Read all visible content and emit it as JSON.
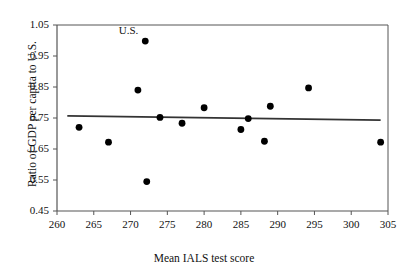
{
  "chart_data": {
    "type": "scatter",
    "title": "",
    "xlabel": "Mean IALS test score",
    "ylabel": "Ratio of GDP per capita to U.S.",
    "xlim": [
      260,
      305
    ],
    "ylim": [
      0.45,
      1.05
    ],
    "xticks": [
      260,
      265,
      270,
      275,
      280,
      285,
      290,
      295,
      300,
      305
    ],
    "yticks": [
      0.45,
      0.55,
      0.65,
      0.75,
      0.85,
      0.95,
      1.05
    ],
    "xtick_labels": [
      "260",
      "265",
      "270",
      "275",
      "280",
      "285",
      "290",
      "295",
      "300",
      "305"
    ],
    "ytick_labels": [
      "0.45",
      "0.55",
      "0.65",
      "0.75",
      "0.85",
      "0.95",
      "1.05"
    ],
    "grid": false,
    "legend": false,
    "marker_color": "#000000",
    "marker_size": 4.6,
    "series": [
      {
        "name": "countries",
        "points": [
          {
            "x": 263.0,
            "y": 0.72
          },
          {
            "x": 267.0,
            "y": 0.672
          },
          {
            "x": 271.0,
            "y": 0.84
          },
          {
            "x": 272.0,
            "y": 0.998,
            "label": "U.S."
          },
          {
            "x": 272.2,
            "y": 0.545
          },
          {
            "x": 274.0,
            "y": 0.752
          },
          {
            "x": 277.0,
            "y": 0.733
          },
          {
            "x": 280.0,
            "y": 0.783
          },
          {
            "x": 285.0,
            "y": 0.713
          },
          {
            "x": 286.0,
            "y": 0.748
          },
          {
            "x": 288.2,
            "y": 0.675
          },
          {
            "x": 289.0,
            "y": 0.788
          },
          {
            "x": 294.2,
            "y": 0.847
          },
          {
            "x": 304.0,
            "y": 0.672
          }
        ]
      }
    ],
    "trendline": {
      "type": "line",
      "color": "#333333",
      "x_start": 261.4,
      "y_start": 0.757,
      "x_end": 304.0,
      "y_end": 0.743
    },
    "annotations": [
      {
        "text": "U.S.",
        "x": 270.3,
        "y": 1.035
      }
    ]
  }
}
